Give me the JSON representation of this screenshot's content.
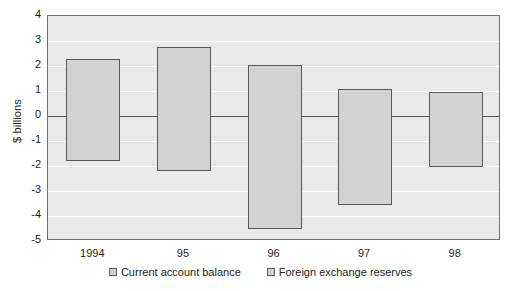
{
  "chart_data": {
    "type": "bar",
    "title": "",
    "subtitle": "",
    "xlabel": "",
    "ylabel": "$ billions",
    "categories": [
      "1994",
      "95",
      "96",
      "97",
      "98"
    ],
    "ylim": [
      -5,
      4
    ],
    "yticks": [
      4,
      3,
      2,
      1,
      0,
      -1,
      -2,
      -3,
      -4,
      -5
    ],
    "ytick_labels": [
      "4",
      "3",
      "2",
      "1",
      "0",
      "-1",
      "-2",
      "-3",
      "-4",
      "-5"
    ],
    "grid": true,
    "legend_position": "bottom",
    "note": "Each category shows a single floating bar spanning from the foreign exchange reserves value (top) down to the current account balance value (bottom).",
    "series": [
      {
        "name": "Foreign exchange reserves",
        "role": "bar-top",
        "values": [
          2.3,
          2.75,
          2.05,
          1.1,
          0.95
        ]
      },
      {
        "name": "Current account balance",
        "role": "bar-bottom",
        "values": [
          -1.8,
          -2.2,
          -4.5,
          -3.55,
          -2.05
        ]
      }
    ],
    "bars": [
      {
        "category": "1994",
        "top": 2.3,
        "bottom": -1.8
      },
      {
        "category": "95",
        "top": 2.75,
        "bottom": -2.2
      },
      {
        "category": "96",
        "top": 2.05,
        "bottom": -4.5
      },
      {
        "category": "97",
        "top": 1.1,
        "bottom": -3.55
      },
      {
        "category": "98",
        "top": 0.95,
        "bottom": -2.05
      }
    ],
    "legend": [
      {
        "label": "Current account balance",
        "color": "#d2d2d2"
      },
      {
        "label": "Foreign exchange reserves",
        "color": "#d2d2d2"
      }
    ],
    "colors": {
      "bar_fill": "#d2d2d2",
      "bar_border": "#58585a",
      "plot_background": "#e9e9e9",
      "gridline": "#ffffff",
      "zeroline": "#58585a",
      "axis_border": "#6f6f6f",
      "text": "#231f20"
    }
  }
}
